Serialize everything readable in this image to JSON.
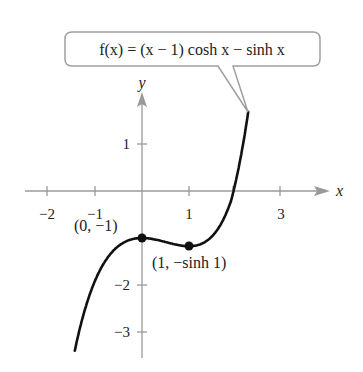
{
  "chart_data": {
    "type": "line",
    "title": "",
    "function_label": "f(x) = (x − 1) cosh x − sinh x",
    "xlabel": "x",
    "ylabel": "y",
    "x_ticks": [
      -2,
      -1,
      1,
      2,
      3
    ],
    "x_tick_labels": [
      "−2",
      "−1",
      "1",
      "3"
    ],
    "y_ticks": [
      1,
      -1,
      -2,
      -3
    ],
    "y_tick_labels": [
      "1",
      "−2",
      "−3"
    ],
    "xlim": [
      -2.1,
      3.7
    ],
    "ylim": [
      -3.6,
      2.1
    ],
    "grid": false,
    "series": [
      {
        "name": "f(x) = (x - 1) cosh x - sinh x",
        "x_range": [
          -1.43,
          2.26
        ],
        "x": [
          -1.43,
          -1.0,
          -0.5,
          0.0,
          0.5,
          1.0,
          1.5,
          2.0,
          2.26
        ],
        "values": [
          -3.4,
          -1.91,
          -1.17,
          -1.0,
          -1.09,
          -1.18,
          -0.93,
          0.14,
          1.36
        ]
      }
    ],
    "annotations": [
      {
        "point": [
          0,
          -1
        ],
        "label": "(0, −1)"
      },
      {
        "point": [
          1,
          -1.1752
        ],
        "label": "(1, −sinh 1)"
      }
    ]
  },
  "labels": {
    "function": "f(x) = (x − 1) cosh x − sinh x",
    "f_part": "f",
    "x_axis": "x",
    "y_axis": "y",
    "point1": "(0, −1)",
    "point2": "(1, −sinh 1)"
  }
}
